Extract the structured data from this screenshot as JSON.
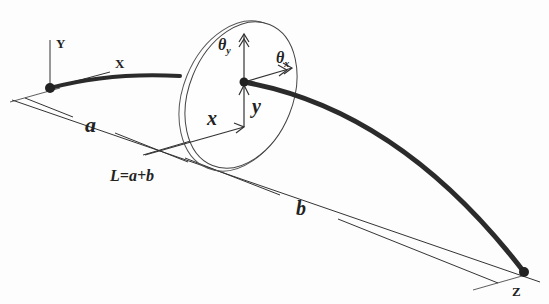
{
  "diagram": {
    "type": "rotor-shaft schematic",
    "labels": {
      "global_y": "Y",
      "global_x": "X",
      "global_z": "Z",
      "segment_a": "a",
      "segment_b": "b",
      "total_length": "L=a+b",
      "local_x": "x",
      "local_y": "y",
      "theta_y_main": "θ",
      "theta_y_sub": "y",
      "theta_x_main": "θ",
      "theta_x_sub": "x"
    },
    "colors": {
      "shaft": "#2b2b2b",
      "line": "#333333",
      "background": "#fdfdfd"
    }
  }
}
